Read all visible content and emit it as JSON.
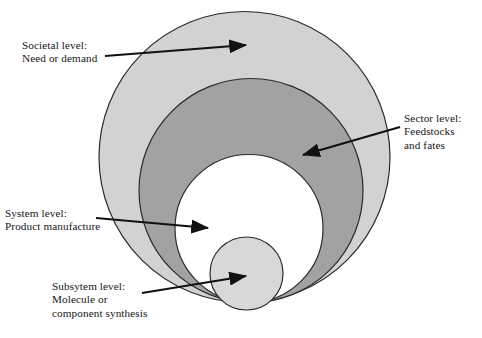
{
  "figure": {
    "type": "nested-circles-diagram",
    "background_color": "#ffffff",
    "outline_color": "#2b2b2b",
    "arrow_color": "#111111"
  },
  "labels": {
    "societal": {
      "name": "societal-level",
      "line1": "Societal level:",
      "line2": "Need or demand"
    },
    "sector": {
      "name": "sector-level",
      "line1": "Sector level:",
      "line2": "Feedstocks",
      "line3": "and fates"
    },
    "system": {
      "name": "system-level",
      "line1": "System level:",
      "line2": "Product manufacture"
    },
    "subsystem": {
      "name": "subsystem-level",
      "line1": "Subsytem level:",
      "line2": "Molecule or",
      "line3": "component synthesis"
    }
  },
  "chart_data": {
    "type": "diagram",
    "title": "",
    "shapes": [
      {
        "id": "societal-circle",
        "label": "Societal level: Need or demand",
        "cx": 244.5,
        "cy": 157,
        "r": 145.5,
        "fill": "#d2d2d2",
        "stroke": "#2b2b2b",
        "stroke_width": 1.2,
        "level": 1
      },
      {
        "id": "sector-circle",
        "label": "Sector level: Feedstocks and fates",
        "cx": 251,
        "cy": 190.5,
        "r": 112,
        "fill": "#a2a2a2",
        "stroke": "#2b2b2b",
        "stroke_width": 1.2,
        "level": 2
      },
      {
        "id": "system-circle",
        "label": "System level: Product manufacture",
        "cx": 249,
        "cy": 228.5,
        "r": 74,
        "fill": "#ffffff",
        "stroke": "#2b2b2b",
        "stroke_width": 1.2,
        "level": 3
      },
      {
        "id": "subsystem-circle",
        "label": "Subsytem level: Molecule or component synthesis",
        "cx": 246.5,
        "cy": 273.5,
        "r": 36.5,
        "fill": "#d8d8d8",
        "stroke": "#2b2b2b",
        "stroke_width": 1.2,
        "level": 4
      }
    ],
    "arrows": [
      {
        "id": "arrow-societal",
        "from": [
          105,
          56
        ],
        "to": [
          246,
          45
        ],
        "target": "societal-circle"
      },
      {
        "id": "arrow-sector",
        "from": [
          400,
          127
        ],
        "to": [
          303,
          155
        ],
        "target": "sector-circle"
      },
      {
        "id": "arrow-system",
        "from": [
          96,
          218
        ],
        "to": [
          208,
          228
        ],
        "target": "system-circle"
      },
      {
        "id": "arrow-subsystem",
        "from": [
          142,
          293
        ],
        "to": [
          246,
          276
        ],
        "target": "subsystem-circle"
      }
    ]
  }
}
